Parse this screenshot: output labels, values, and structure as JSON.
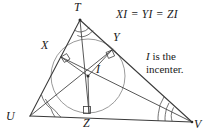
{
  "figure": {
    "background_color": "#ffffff",
    "stroke_color": "#3a3a3a",
    "circle_color": "#8a8a8a",
    "text_color": "#1a1a1a",
    "width": 210,
    "height": 137
  },
  "annotations": {
    "equation": "XI = YI = ZI",
    "statement_line1_italic": "I",
    "statement_line1_rest": " is the",
    "statement_line2": "incenter."
  },
  "vertices": [
    {
      "name": "T",
      "label": "T",
      "x": 80,
      "y": 20,
      "label_x": 74,
      "label_y": 2
    },
    {
      "name": "U",
      "label": "U",
      "x": 30,
      "y": 116,
      "label_x": 8,
      "label_y": 116
    },
    {
      "name": "V",
      "label": "V",
      "x": 192,
      "y": 122,
      "label_x": 194,
      "label_y": 122
    }
  ],
  "tangent_points": [
    {
      "name": "X",
      "label": "X",
      "x": 61,
      "y": 57,
      "label_x": 42,
      "label_y": 41,
      "side": "TU"
    },
    {
      "name": "Y",
      "label": "Y",
      "x": 112,
      "y": 50,
      "label_x": 114,
      "label_y": 32,
      "side": "TV"
    },
    {
      "name": "Z",
      "label": "Z",
      "x": 89,
      "y": 113,
      "label_x": 84,
      "label_y": 120,
      "side": "UV"
    }
  ],
  "incenter": {
    "name": "I",
    "label": "I",
    "x": 88,
    "y": 76,
    "label_x": 96,
    "label_y": 66
  },
  "incircle": {
    "center_x": 88,
    "center_y": 76,
    "radius": 37
  },
  "markers": {
    "right_angle_count": 3,
    "angle_arc_vertices": [
      "T",
      "U",
      "V"
    ],
    "bisector_segments": [
      "T-I-Z",
      "U-I-Y",
      "V-I-X"
    ]
  }
}
